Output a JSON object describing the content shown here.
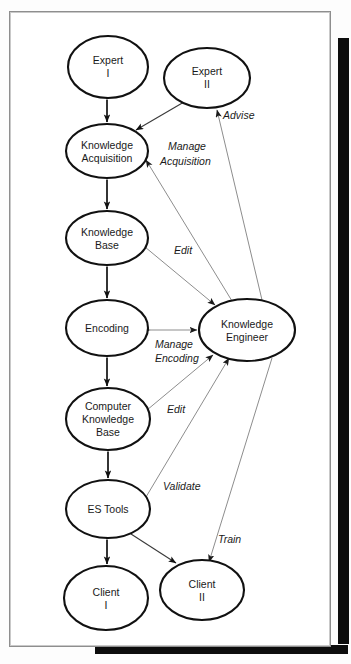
{
  "diagram": {
    "nodes": [
      {
        "id": "expert-i",
        "label_lines": [
          "Expert",
          "I"
        ],
        "cx": 108,
        "cy": 67,
        "rx": 40,
        "ry": 31
      },
      {
        "id": "expert-ii",
        "label_lines": [
          "Expert",
          "II"
        ],
        "cx": 207,
        "cy": 78,
        "rx": 43,
        "ry": 30
      },
      {
        "id": "knowledge-acquisition",
        "label_lines": [
          "Knowledge",
          "Acquisition"
        ],
        "cx": 107,
        "cy": 151,
        "rx": 41,
        "ry": 27
      },
      {
        "id": "knowledge-base",
        "label_lines": [
          "Knowledge",
          "Base"
        ],
        "cx": 107,
        "cy": 238,
        "rx": 41,
        "ry": 27
      },
      {
        "id": "encoding",
        "label_lines": [
          "Encoding"
        ],
        "cx": 107,
        "cy": 328,
        "rx": 41,
        "ry": 28
      },
      {
        "id": "knowledge-engineer",
        "label_lines": [
          "Knowledge",
          "Engineer"
        ],
        "cx": 247,
        "cy": 330,
        "rx": 48,
        "ry": 31
      },
      {
        "id": "computer-knowledge-base",
        "label_lines": [
          "Computer",
          "Knowledge",
          "Base"
        ],
        "cx": 108,
        "cy": 419,
        "rx": 42,
        "ry": 31
      },
      {
        "id": "es-tools",
        "label_lines": [
          "ES Tools"
        ],
        "cx": 108,
        "cy": 509,
        "rx": 42,
        "ry": 29
      },
      {
        "id": "client-i",
        "label_lines": [
          "Client",
          "I"
        ],
        "cx": 106,
        "cy": 598,
        "rx": 42,
        "ry": 32
      },
      {
        "id": "client-ii",
        "label_lines": [
          "Client",
          "II"
        ],
        "cx": 202,
        "cy": 590,
        "rx": 42,
        "ry": 30
      }
    ],
    "edge_labels": [
      {
        "id": "advise",
        "text": "Advise",
        "x": 223,
        "y": 119
      },
      {
        "id": "manage-acquisition-1",
        "text": "Manage",
        "x": 168,
        "y": 150
      },
      {
        "id": "manage-acquisition-2",
        "text": "Acquisition",
        "x": 160,
        "y": 165
      },
      {
        "id": "edit-kb",
        "text": "Edit",
        "x": 174,
        "y": 254
      },
      {
        "id": "manage-encoding-1",
        "text": "Manage",
        "x": 155,
        "y": 348
      },
      {
        "id": "manage-encoding-2",
        "text": "Encoding",
        "x": 155,
        "y": 362
      },
      {
        "id": "edit-ckb",
        "text": "Edit",
        "x": 167,
        "y": 413
      },
      {
        "id": "validate",
        "text": "Validate",
        "x": 163,
        "y": 490
      },
      {
        "id": "train",
        "text": "Train",
        "x": 218,
        "y": 543
      }
    ],
    "relationships": [
      {
        "from": "expert-i",
        "to": "knowledge-acquisition",
        "type": "bidirectional",
        "label": ""
      },
      {
        "from": "knowledge-acquisition",
        "to": "knowledge-base",
        "type": "bidirectional",
        "label": ""
      },
      {
        "from": "knowledge-base",
        "to": "encoding",
        "type": "bidirectional",
        "label": ""
      },
      {
        "from": "encoding",
        "to": "computer-knowledge-base",
        "type": "bidirectional",
        "label": ""
      },
      {
        "from": "computer-knowledge-base",
        "to": "es-tools",
        "type": "bidirectional",
        "label": ""
      },
      {
        "from": "es-tools",
        "to": "client-i",
        "type": "bidirectional",
        "label": ""
      },
      {
        "from": "expert-ii",
        "to": "knowledge-acquisition",
        "type": "bidirectional",
        "label": ""
      },
      {
        "from": "knowledge-engineer",
        "to": "expert-ii",
        "type": "directed",
        "label": "Advise"
      },
      {
        "from": "knowledge-engineer",
        "to": "knowledge-acquisition",
        "type": "directed",
        "label": "Manage Acquisition"
      },
      {
        "from": "knowledge-base",
        "to": "knowledge-engineer",
        "type": "bidirectional",
        "label": "Edit"
      },
      {
        "from": "encoding",
        "to": "knowledge-engineer",
        "type": "bidirectional",
        "label": "Manage Encoding"
      },
      {
        "from": "computer-knowledge-base",
        "to": "knowledge-engineer",
        "type": "bidirectional",
        "label": "Edit"
      },
      {
        "from": "es-tools",
        "to": "knowledge-engineer",
        "type": "bidirectional",
        "label": "Validate"
      },
      {
        "from": "knowledge-engineer",
        "to": "client-ii",
        "type": "directed",
        "label": "Train"
      },
      {
        "from": "es-tools",
        "to": "client-ii",
        "type": "bidirectional",
        "label": ""
      }
    ],
    "colors": {
      "node_stroke": "#111111",
      "node_fill": "#ffffff",
      "thin_link": "#8d8d8d",
      "page_background": "#ffffff",
      "shadow": "#0d0d0d"
    }
  }
}
